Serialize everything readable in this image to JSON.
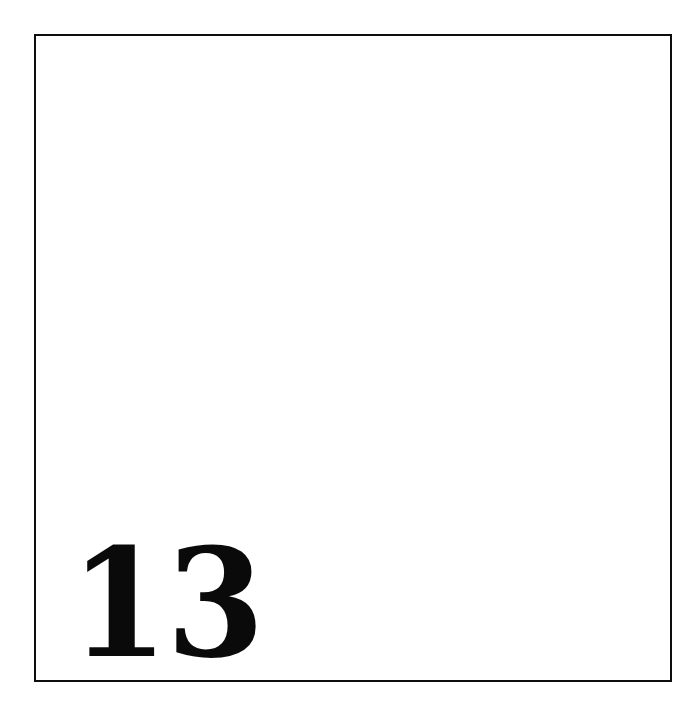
{
  "page": {
    "kind": "scanned-book-page",
    "background_color": "#ffffff",
    "ink_color": "#0a0a0a",
    "width": 688,
    "height": 721
  },
  "frame": {
    "name": "printed-rule-border",
    "border_color": "#0d0d0d",
    "border_width_px": 2,
    "left": 34,
    "top": 34,
    "width": 638,
    "height": 648
  },
  "content": {
    "body_text": "",
    "is_blank": true
  },
  "folio": {
    "label": "13",
    "position": "bottom-left",
    "color": "#0a0a0a"
  }
}
